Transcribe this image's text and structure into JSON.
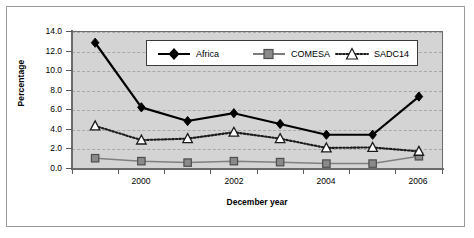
{
  "chart_data": {
    "type": "line",
    "title": "",
    "xlabel": "December year",
    "ylabel": "Percentage",
    "categories": [
      "1999",
      "2000",
      "2001",
      "2002",
      "2003",
      "2004",
      "2005",
      "2006"
    ],
    "x_tick_labels": [
      "",
      "2000",
      "",
      "2002",
      "",
      "2004",
      "",
      "2006"
    ],
    "y_tick_labels": [
      "0.0",
      "2.0",
      "4.0",
      "6.0",
      "8.0",
      "10.0",
      "12.0",
      "14.0"
    ],
    "ylim": [
      0.0,
      14.0
    ],
    "y_step": 2.0,
    "grid": true,
    "legend_position": "upper-center",
    "series": [
      {
        "name": "Africa",
        "values": [
          12.8,
          6.2,
          4.8,
          5.6,
          4.5,
          3.4,
          3.4,
          7.3
        ],
        "color": "#000000",
        "line_style": "solid",
        "marker": "diamond",
        "marker_fill": "#000000"
      },
      {
        "name": "COMESA",
        "values": [
          1.0,
          0.7,
          0.55,
          0.7,
          0.6,
          0.45,
          0.45,
          1.2
        ],
        "color": "#808080",
        "line_style": "solid",
        "marker": "square",
        "marker_fill": "#8a8a8a"
      },
      {
        "name": "SADC14",
        "values": [
          4.3,
          2.85,
          3.0,
          3.65,
          3.0,
          2.05,
          2.1,
          1.7
        ],
        "color": "#1a1a1a",
        "line_style": "dotted",
        "marker": "triangle",
        "marker_fill": "#ffffff"
      }
    ]
  },
  "legend": {
    "entries": [
      {
        "label": "Africa"
      },
      {
        "label": "COMESA"
      },
      {
        "label": "SADC14"
      }
    ]
  },
  "axes": {
    "y_title": "Percentage",
    "x_title": "December year"
  },
  "colors": {
    "plot_background": "#d4d4d4",
    "figure_background": "#ffffff",
    "frame": "#9a9a9a",
    "axis": "#6b6b6b",
    "gridline": "#a8a8a8",
    "africa": "#000000",
    "comesa": "#808080",
    "sadc14": "#1a1a1a"
  }
}
